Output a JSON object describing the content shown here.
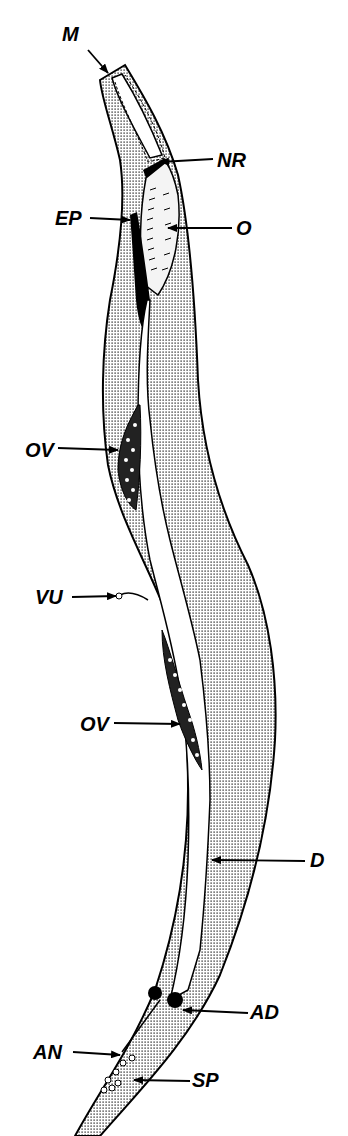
{
  "figure": {
    "colors": {
      "ink": "#000000",
      "background": "#ffffff",
      "stipple": "#000000"
    }
  },
  "labels": {
    "M": {
      "text": "M",
      "x": 62,
      "y": 24
    },
    "NR": {
      "text": "NR",
      "x": 217,
      "y": 152
    },
    "EP": {
      "text": "EP",
      "x": 55,
      "y": 208
    },
    "O": {
      "text": "O",
      "x": 236,
      "y": 215
    },
    "OV1": {
      "text": "OV",
      "x": 25,
      "y": 443
    },
    "VU": {
      "text": "VU",
      "x": 35,
      "y": 590
    },
    "OV2": {
      "text": "OV",
      "x": 80,
      "y": 716
    },
    "D": {
      "text": "D",
      "x": 310,
      "y": 852
    },
    "AD": {
      "text": "AD",
      "x": 250,
      "y": 1000
    },
    "AN": {
      "text": "AN",
      "x": 33,
      "y": 1040
    },
    "SP": {
      "text": "SP",
      "x": 192,
      "y": 1070
    }
  }
}
